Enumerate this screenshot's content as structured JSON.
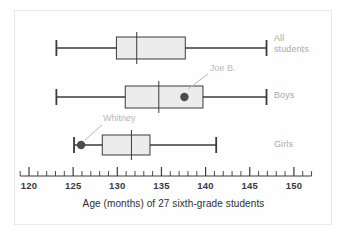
{
  "figure": {
    "caption": "Age (months) of 27 sixth-grade students",
    "frame_color": "#e9e9ea",
    "line_color": "#3a3a3c",
    "box_fill": "#ececec",
    "label_color": "#a9a9ab",
    "annotation_color": "#b7b7b9",
    "dot_color": "#4d4d4f"
  },
  "chart_data": {
    "type": "box",
    "title": "",
    "xlabel": "Age (months) of 27 sixth-grade students",
    "ylabel": "",
    "xlim": [
      119.3,
      152.2
    ],
    "grid": false,
    "axis": {
      "major_ticks": [
        120,
        125,
        130,
        135,
        140,
        145,
        150
      ],
      "tick_labels": [
        "120",
        "125",
        "130",
        "135",
        "140",
        "145",
        "150"
      ],
      "minor_tick_step": 1,
      "minor_tick_start": 119,
      "minor_tick_end": 152
    },
    "series": [
      {
        "name": "All students",
        "label": "All\nstudents",
        "min": 123.1,
        "q1": 129.9,
        "median": 132.2,
        "q3": 137.7,
        "max": 146.9
      },
      {
        "name": "Boys",
        "label": "Boys",
        "min": 123.1,
        "q1": 130.9,
        "median": 134.7,
        "q3": 139.7,
        "max": 146.9
      },
      {
        "name": "Girls",
        "label": "Girls",
        "min": 125.1,
        "q1": 128.3,
        "median": 131.6,
        "q3": 133.7,
        "max": 141.2
      }
    ],
    "annotations": [
      {
        "name": "Joe B.",
        "text": "Joe B.",
        "series": "Boys",
        "value": 137.6,
        "text_x": 210,
        "text_y": 63,
        "leader_from_x": 208,
        "leader_from_y": 74,
        "leader_to_x": 188,
        "leader_to_y": 89
      },
      {
        "name": "Whitney",
        "text": "Whitney",
        "series": "Girls",
        "value": 125.9,
        "text_x": 103,
        "text_y": 113,
        "leader_from_x": 102,
        "leader_from_y": 125,
        "leader_to_x": 85,
        "leader_to_y": 140
      }
    ]
  }
}
